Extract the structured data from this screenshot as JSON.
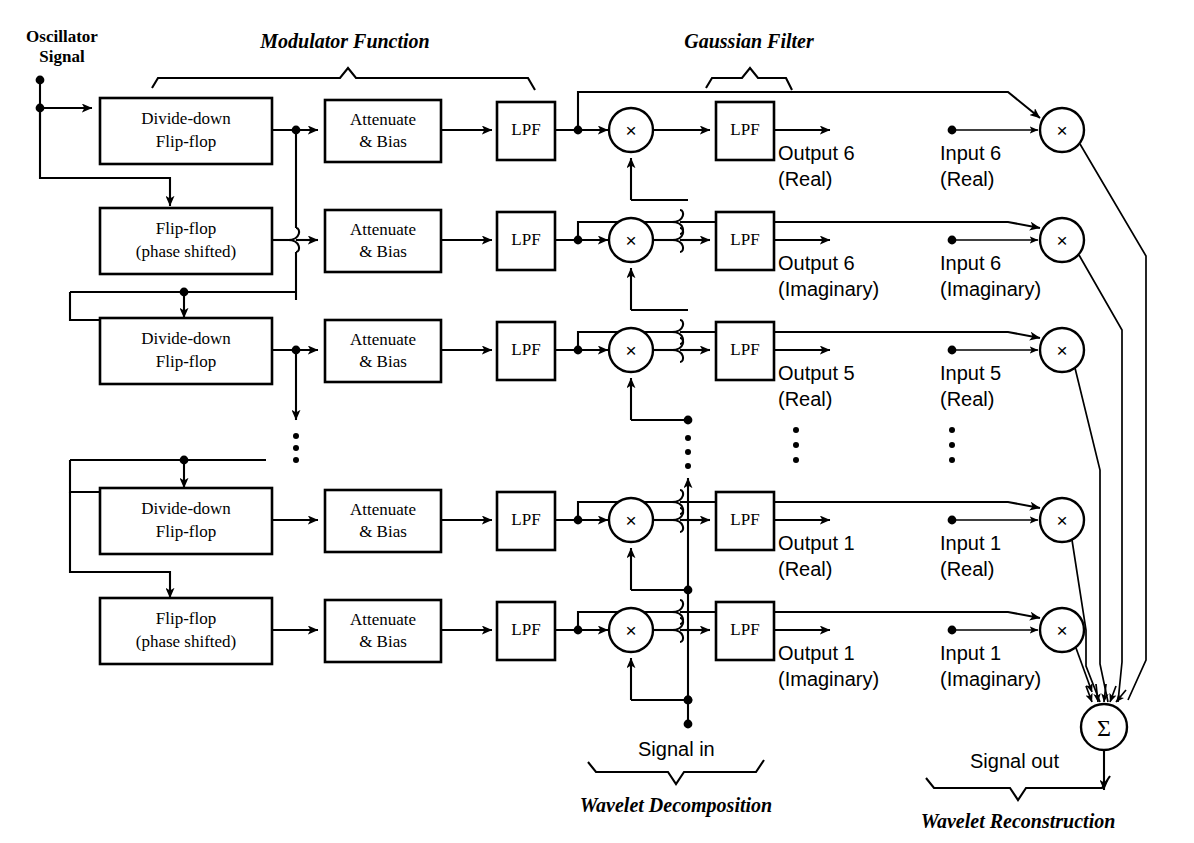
{
  "figure": {
    "sections": [
      {
        "id": "modulator",
        "label": "Modulator Function"
      },
      {
        "id": "gaussian",
        "label": "Gaussian Filter"
      },
      {
        "id": "decomposition",
        "label": "Wavelet Decomposition"
      },
      {
        "id": "reconstruction",
        "label": "Wavelet Reconstruction"
      }
    ]
  },
  "terminals": {
    "oscillator_line1": "Oscillator",
    "oscillator_line2": "Signal",
    "signal_in": "Signal in",
    "signal_out": "Signal out"
  },
  "rows": [
    {
      "index": 0,
      "flipflop_line1": "Divide-down",
      "flipflop_line2": "Flip-flop",
      "attenuate_line1": "Attenuate",
      "attenuate_line2": "& Bias",
      "lpf_mod": "LPF",
      "lpf_gauss": "LPF",
      "mult_glyph": "×",
      "recon_mult_glyph": "×",
      "output_line1": "Output 6",
      "output_line2": "(Real)",
      "input_line1": "Input 6",
      "input_line2": "(Real)"
    },
    {
      "index": 1,
      "flipflop_line1": "Flip-flop",
      "flipflop_line2": "(phase shifted)",
      "attenuate_line1": "Attenuate",
      "attenuate_line2": "& Bias",
      "lpf_mod": "LPF",
      "lpf_gauss": "LPF",
      "mult_glyph": "×",
      "recon_mult_glyph": "×",
      "output_line1": "Output 6",
      "output_line2": "(Imaginary)",
      "input_line1": "Input 6",
      "input_line2": "(Imaginary)"
    },
    {
      "index": 2,
      "flipflop_line1": "Divide-down",
      "flipflop_line2": "Flip-flop",
      "attenuate_line1": "Attenuate",
      "attenuate_line2": "& Bias",
      "lpf_mod": "LPF",
      "lpf_gauss": "LPF",
      "mult_glyph": "×",
      "recon_mult_glyph": "×",
      "output_line1": "Output 5",
      "output_line2": "(Real)",
      "input_line1": "Input 5",
      "input_line2": "(Real)"
    },
    {
      "index": 3,
      "flipflop_line1": "Divide-down",
      "flipflop_line2": "Flip-flop",
      "attenuate_line1": "Attenuate",
      "attenuate_line2": "& Bias",
      "lpf_mod": "LPF",
      "lpf_gauss": "LPF",
      "mult_glyph": "×",
      "recon_mult_glyph": "×",
      "output_line1": "Output 1",
      "output_line2": "(Real)",
      "input_line1": "Input 1",
      "input_line2": "(Real)"
    },
    {
      "index": 4,
      "flipflop_line1": "Flip-flop",
      "flipflop_line2": "(phase shifted)",
      "attenuate_line1": "Attenuate",
      "attenuate_line2": "& Bias",
      "lpf_mod": "LPF",
      "lpf_gauss": "LPF",
      "mult_glyph": "×",
      "recon_mult_glyph": "×",
      "output_line1": "Output 1",
      "output_line2": "(Imaginary)",
      "input_line1": "Input 1",
      "input_line2": "(Imaginary)"
    }
  ],
  "summation": {
    "glyph": "Σ"
  },
  "continuation": {
    "marker": "vertical-ellipsis",
    "count": 4
  },
  "colors": {
    "ink": "#000000",
    "paper": "#ffffff"
  }
}
